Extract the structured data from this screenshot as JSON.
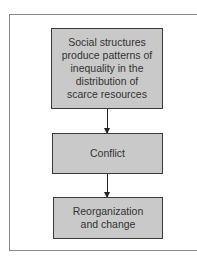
{
  "diagram": {
    "type": "flowchart",
    "direction": "top-to-bottom",
    "nodes": [
      {
        "id": "n1",
        "label": "Social structures\nproduce patterns of\ninequality in the\ndistribution of\nscarce resources"
      },
      {
        "id": "n2",
        "label": "Conflict"
      },
      {
        "id": "n3",
        "label": "Reorganization\nand change"
      }
    ],
    "edges": [
      {
        "from": "n1",
        "to": "n2"
      },
      {
        "from": "n2",
        "to": "n3"
      }
    ],
    "colors": {
      "box_fill": "#c9c9c9",
      "box_border": "#3a3a3a",
      "frame": "#8a8a8a",
      "arrow": "#222222"
    }
  }
}
